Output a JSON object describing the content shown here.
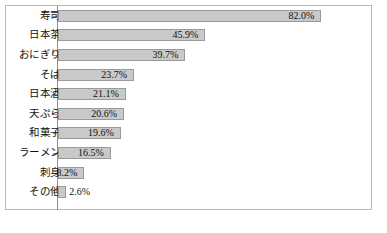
{
  "chart_data": {
    "type": "bar",
    "orientation": "horizontal",
    "title": "",
    "xlabel": "",
    "ylabel": "",
    "xlim": [
      0,
      100
    ],
    "grid": false,
    "legend": false,
    "categories": [
      "寿司",
      "日本茶",
      "おにぎり",
      "そば",
      "日本酒",
      "天ぷら",
      "和菓子",
      "ラーメン",
      "刺身",
      "その他"
    ],
    "values": [
      82.0,
      45.9,
      39.7,
      23.7,
      21.1,
      20.6,
      19.6,
      16.5,
      8.2,
      2.6
    ],
    "value_labels": [
      "82.0%",
      "45.9%",
      "39.7%",
      "23.7%",
      "21.1%",
      "20.6%",
      "19.6%",
      "16.5%",
      "8.2%",
      "2.6%"
    ],
    "label_placement": [
      "inside",
      "inside",
      "inside",
      "inside",
      "inside",
      "inside",
      "inside",
      "inside",
      "inside",
      "outside"
    ],
    "bar_color": "#c9c9c9",
    "bar_border_color": "#9a9a9a",
    "frame_color": "#b9b9b9",
    "axis_color": "#8e8e8e"
  },
  "caption": ""
}
